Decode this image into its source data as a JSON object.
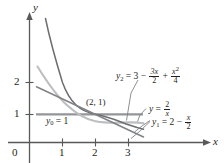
{
  "figure": {
    "axes": {
      "y_axis_label": "y",
      "x_axis_label": "x",
      "origin_label": "0",
      "y_ticks": [
        "1",
        "2"
      ],
      "x_ticks": [
        "1",
        "2",
        "3"
      ]
    },
    "annotations": {
      "point_label": "(2, 1)",
      "y0": {
        "lhs": "y",
        "sub": "0",
        "rhs": "= 1"
      },
      "y_hyperbola": {
        "lhs": "y",
        "eq": "=",
        "num": "2",
        "den": "x"
      },
      "y1": {
        "lhs": "y",
        "sub": "1",
        "eq": "= 2",
        "minus": "−",
        "num": "x",
        "den": "2"
      },
      "y2": {
        "lhs": "y",
        "sub": "2",
        "eq": "= 3",
        "minus1": "−",
        "num1": "3x",
        "den1": "2",
        "plus": "+",
        "num2": "x",
        "sup2": "2",
        "den2": "4"
      }
    },
    "curves": [
      {
        "name": "hyperbola-y-equals-2-over-x",
        "color": "#6d6e71",
        "width": 1.4
      },
      {
        "name": "parabola-y2",
        "color": "#bcbec0",
        "width": 1.8
      },
      {
        "name": "line-y1",
        "color": "#808285",
        "width": 1.4
      },
      {
        "name": "horizontal-line-y0",
        "color": "#939598",
        "width": 2.0
      }
    ],
    "colors": {
      "axis": "#58595b",
      "text": "#231f20",
      "leader": "#808285"
    }
  }
}
